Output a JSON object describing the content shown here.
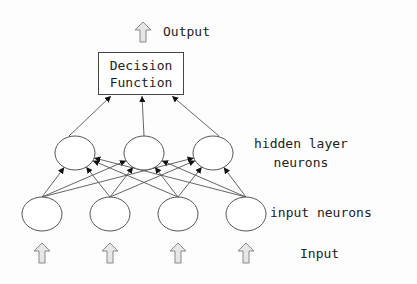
{
  "diagram": {
    "output_label": "Output",
    "decision_box": {
      "line1": "Decision",
      "line2": "Function"
    },
    "hidden_label": {
      "line1": "hidden layer",
      "line2": "neurons"
    },
    "input_neurons_label": "input neurons",
    "input_label": "Input",
    "hidden_neurons": [
      {
        "cx": 75,
        "cy": 153
      },
      {
        "cx": 144,
        "cy": 153
      },
      {
        "cx": 213,
        "cy": 153
      }
    ],
    "input_neurons": [
      {
        "cx": 42,
        "cy": 214
      },
      {
        "cx": 110,
        "cy": 214
      },
      {
        "cx": 178,
        "cy": 214
      },
      {
        "cx": 246,
        "cy": 214
      }
    ],
    "colors": {
      "stroke": "#555555",
      "arrow_fill": "#e6e6e6",
      "arrow_stroke": "#888888",
      "text": "#222222"
    }
  }
}
